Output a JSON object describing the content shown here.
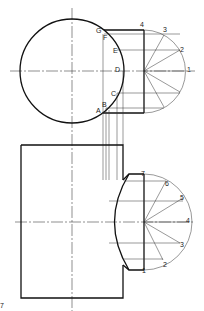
{
  "figure": {
    "type": "orthographic-construction",
    "top_view": {
      "circle_labels": [
        "A",
        "B",
        "C",
        "D",
        "E",
        "F",
        "G"
      ],
      "semicircle_labels": [
        "1",
        "2",
        "3",
        "4"
      ]
    },
    "front_view": {
      "semicircle_labels": [
        "1",
        "2",
        "3",
        "4",
        "5",
        "6",
        "7"
      ]
    },
    "corner_label": "7",
    "colors": {
      "line": "#111111",
      "background": "#ffffff"
    }
  }
}
